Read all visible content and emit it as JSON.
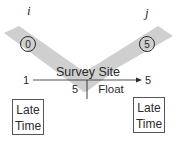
{
  "diagram": {
    "left_node_label": "i",
    "right_node_label": "j",
    "left_event_number": "0",
    "right_event_number": "5",
    "activity_name": "Survey Site",
    "early_start": "1",
    "early_finish": "5",
    "duration": "5",
    "float_label": "Float",
    "left_box": {
      "line1": "Late",
      "line2": "Time"
    },
    "right_box": {
      "line1": "Late",
      "line2": "Time"
    },
    "colors": {
      "band": "#cfcfcf",
      "ink": "#2a2a2a"
    }
  }
}
